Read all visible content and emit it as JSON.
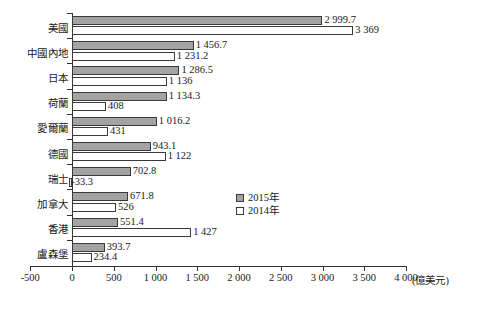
{
  "chart_data": {
    "type": "bar",
    "orientation": "horizontal",
    "title": "",
    "subtitle": "",
    "xlabel": "(億美元)",
    "ylabel": "",
    "xlim": [
      -500,
      4000
    ],
    "xticks": [
      -500,
      0,
      500,
      1000,
      1500,
      2000,
      2500,
      3000,
      3500,
      4000
    ],
    "xtick_labels": [
      "-500",
      "0",
      "500",
      "1 000",
      "1 500",
      "2 000",
      "2 500",
      "3 000",
      "3 500",
      "4 000"
    ],
    "grid": false,
    "legend_position": "center-right",
    "categories": [
      "美國",
      "中國內地",
      "日本",
      "荷蘭",
      "愛爾蘭",
      "德國",
      "瑞士",
      "加拿大",
      "香港",
      "盧森堡"
    ],
    "series": [
      {
        "name": "2015年",
        "color": "#a3a3a3",
        "values": [
          2999.7,
          1456.7,
          1286.5,
          1134.3,
          1016.2,
          943.1,
          702.8,
          671.8,
          551.4,
          393.7
        ],
        "labels": [
          "2 999.7",
          "1 456.7",
          "1 286.5",
          "1 134.3",
          "1 016.2",
          "943.1",
          "702.8",
          "671.8",
          "551.4",
          "393.7"
        ]
      },
      {
        "name": "2014年",
        "color": "#ffffff",
        "values": [
          3369,
          1231.2,
          1136,
          408,
          431,
          1122,
          -33.3,
          526,
          1427,
          234.4
        ],
        "labels": [
          "3 369",
          "1 231.2",
          "1 136",
          "408",
          "431",
          "1 122",
          "-33.3",
          "526",
          "1 427",
          "234.4"
        ]
      }
    ]
  },
  "legend": {
    "items": [
      {
        "label": "2015年",
        "swatch": "filled-gray"
      },
      {
        "label": "2014年",
        "swatch": "hollow-white"
      }
    ]
  }
}
